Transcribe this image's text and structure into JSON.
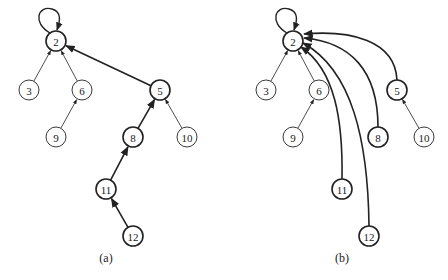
{
  "colors": {
    "stroke": "#222222",
    "background": "#ffffff"
  },
  "panels": [
    {
      "id": "a",
      "caption": "(a)",
      "caption_pos": [
        106,
        262
      ],
      "nodes": [
        {
          "label": "2",
          "x": 56,
          "y": 41,
          "bold": true
        },
        {
          "label": "3",
          "x": 29,
          "y": 90,
          "bold": false
        },
        {
          "label": "6",
          "x": 82,
          "y": 90,
          "bold": false
        },
        {
          "label": "5",
          "x": 160,
          "y": 90,
          "bold": true
        },
        {
          "label": "9",
          "x": 56,
          "y": 137,
          "bold": false
        },
        {
          "label": "8",
          "x": 133,
          "y": 137,
          "bold": true
        },
        {
          "label": "10",
          "x": 187,
          "y": 137,
          "bold": false
        },
        {
          "label": "11",
          "x": 106,
          "y": 189,
          "bold": true
        },
        {
          "label": "12",
          "x": 133,
          "y": 236,
          "bold": true
        }
      ],
      "edges": [
        {
          "from": "3",
          "to": "2",
          "bold": false,
          "curve": 0
        },
        {
          "from": "6",
          "to": "2",
          "bold": false,
          "curve": 0
        },
        {
          "from": "5",
          "to": "2",
          "bold": true,
          "curve": 0
        },
        {
          "from": "9",
          "to": "6",
          "bold": false,
          "curve": 0
        },
        {
          "from": "8",
          "to": "5",
          "bold": true,
          "curve": 0
        },
        {
          "from": "10",
          "to": "5",
          "bold": false,
          "curve": 0
        },
        {
          "from": "11",
          "to": "8",
          "bold": true,
          "curve": 0
        },
        {
          "from": "12",
          "to": "11",
          "bold": true,
          "curve": 0
        }
      ],
      "self_loop": "2"
    },
    {
      "id": "b",
      "caption": "(b)",
      "caption_pos": [
        342,
        262
      ],
      "nodes": [
        {
          "label": "2",
          "x": 293,
          "y": 41,
          "bold": true
        },
        {
          "label": "3",
          "x": 266,
          "y": 90,
          "bold": false
        },
        {
          "label": "6",
          "x": 319,
          "y": 90,
          "bold": false
        },
        {
          "label": "5",
          "x": 397,
          "y": 90,
          "bold": true
        },
        {
          "label": "9",
          "x": 293,
          "y": 137,
          "bold": false
        },
        {
          "label": "8",
          "x": 378,
          "y": 137,
          "bold": true
        },
        {
          "label": "10",
          "x": 424,
          "y": 137,
          "bold": false
        },
        {
          "label": "11",
          "x": 342,
          "y": 189,
          "bold": true
        },
        {
          "label": "12",
          "x": 369,
          "y": 236,
          "bold": true
        }
      ],
      "edges": [
        {
          "from": "3",
          "to": "2",
          "bold": false,
          "curve": 0
        },
        {
          "from": "6",
          "to": "2",
          "bold": false,
          "curve": 0
        },
        {
          "from": "9",
          "to": "6",
          "bold": false,
          "curve": 0
        },
        {
          "from": "10",
          "to": "5",
          "bold": false,
          "curve": 0
        },
        {
          "from": "5",
          "to": "2",
          "bold": true,
          "curve": 1,
          "path": "M397,80 C395,40 350,30 304,34"
        },
        {
          "from": "8",
          "to": "2",
          "bold": true,
          "curve": 1,
          "path": "M378,127 C378,70 350,42 304,38"
        },
        {
          "from": "12",
          "to": "2",
          "bold": true,
          "curve": 1,
          "path": "M369,226 C368,140 352,70 303,43"
        },
        {
          "from": "11",
          "to": "2",
          "bold": true,
          "curve": 1,
          "path": "M342,179 C343,120 335,70 301,47"
        }
      ],
      "self_loop": "2"
    }
  ]
}
